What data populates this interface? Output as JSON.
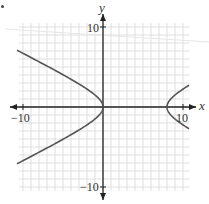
{
  "chart_data": {
    "type": "line",
    "title": "",
    "xlabel": "x",
    "ylabel": "y",
    "xlim": [
      -10.5,
      10.75
    ],
    "ylim": [
      -10.5,
      10.5
    ],
    "grid": true,
    "grid_step": 1,
    "x_tick_labels": [
      {
        "value": -10,
        "label": "−10"
      },
      {
        "value": 10,
        "label": "10"
      }
    ],
    "y_tick_labels": [
      {
        "value": 10,
        "label": "10"
      },
      {
        "value": -10,
        "label": "−10"
      }
    ],
    "equation": "(x-4)^2/16 - y^2/4 = 1",
    "center": [
      4,
      0
    ],
    "vertices": [
      [
        0,
        0
      ],
      [
        8,
        0
      ]
    ],
    "series": [
      {
        "name": "left-branch",
        "points": [
          [
            -10.75,
            7.0
          ],
          [
            -8,
            5.2
          ],
          [
            -6,
            4.0
          ],
          [
            -4,
            2.9
          ],
          [
            -2,
            1.7
          ],
          [
            -1,
            1.0
          ],
          [
            0,
            0
          ],
          [
            -1,
            -1.0
          ],
          [
            -2,
            -1.7
          ],
          [
            -4,
            -2.9
          ],
          [
            -6,
            -4.0
          ],
          [
            -8,
            -5.2
          ],
          [
            -10.75,
            -7.0
          ]
        ]
      },
      {
        "name": "right-branch",
        "points": [
          [
            10.75,
            2.7
          ],
          [
            10,
            2.2
          ],
          [
            9,
            1.5
          ],
          [
            8.5,
            1.0
          ],
          [
            8,
            0
          ],
          [
            8.5,
            -1.0
          ],
          [
            9,
            -1.5
          ],
          [
            10,
            -2.2
          ],
          [
            10.75,
            -2.7
          ]
        ]
      }
    ]
  },
  "labels": {
    "x_axis": "x",
    "y_axis": "y",
    "x_tick_neg": "−10",
    "x_tick_pos": "10",
    "y_tick_pos": "10",
    "y_tick_neg": "−10"
  },
  "colors": {
    "grid": "#d8d8d8",
    "axis": "#222222",
    "curve": "#555555"
  }
}
